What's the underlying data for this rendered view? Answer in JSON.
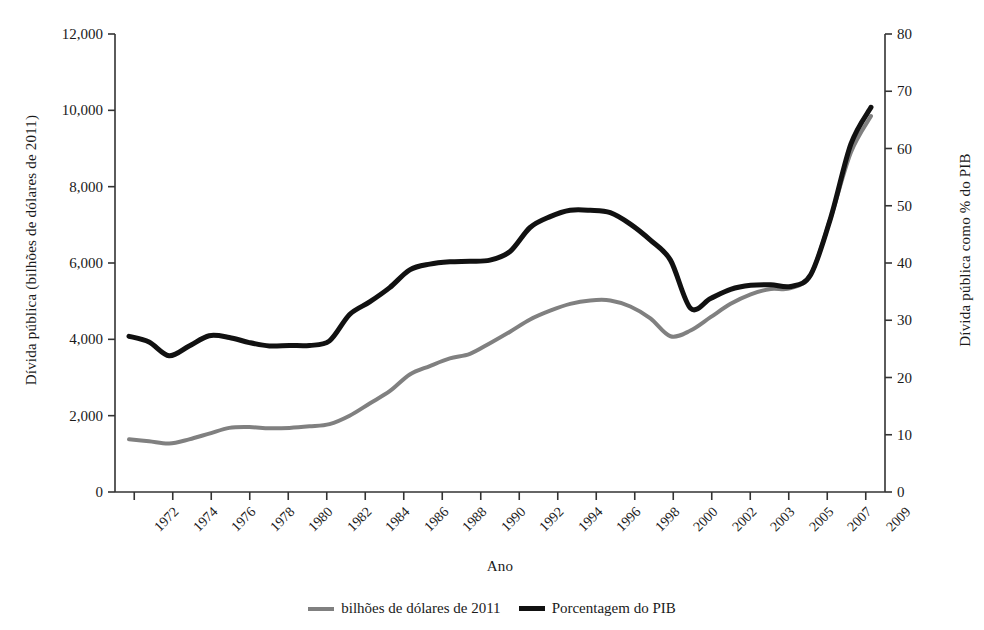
{
  "chart_data": {
    "type": "line",
    "title": "",
    "xlabel": "Ano",
    "ylabel_left": "Dívida pública (bilhões de dólares de 2011)",
    "ylabel_right": "Dívida pública como % do PIB",
    "grid": false,
    "legend_position": "bottom-center",
    "x_tick_labels": [
      "1972",
      "1974",
      "1976",
      "1978",
      "1980",
      "1982",
      "1984",
      "1986",
      "1988",
      "1990",
      "1992",
      "1994",
      "1996",
      "1998",
      "2000",
      "2002",
      "2003",
      "2005",
      "2007",
      "2009"
    ],
    "x_tick_count": 20,
    "y_left_ticks": [
      "0",
      "2,000",
      "4,000",
      "6,000",
      "8,000",
      "10,000",
      "12,000"
    ],
    "y_left_lim": [
      0,
      12000
    ],
    "y_right_ticks": [
      "0",
      "10",
      "20",
      "30",
      "40",
      "50",
      "60",
      "70",
      "80"
    ],
    "y_right_lim": [
      0,
      80
    ],
    "series": [
      {
        "name": "bilhões de dólares de 2011",
        "color": "#808080",
        "axis": "left",
        "linewidth": 4,
        "values": [
          1380,
          1330,
          1270,
          1380,
          1530,
          1680,
          1700,
          1670,
          1680,
          1720,
          1780,
          2000,
          2320,
          2640,
          3080,
          3300,
          3500,
          3620,
          3900,
          4200,
          4520,
          4750,
          4930,
          5020,
          5020,
          4860,
          4550,
          4080,
          4230,
          4580,
          4930,
          5180,
          5320,
          5340,
          5700,
          7200,
          8900,
          9850
        ]
      },
      {
        "name": "Porcentagem do PIB",
        "color": "#111111",
        "axis": "right",
        "linewidth": 5,
        "values": [
          27.2,
          26.2,
          23.8,
          25.5,
          27.3,
          27.0,
          26.1,
          25.5,
          25.6,
          25.6,
          26.4,
          31.0,
          33.2,
          35.7,
          38.8,
          39.8,
          40.2,
          40.3,
          40.5,
          42.0,
          46.2,
          48.1,
          49.2,
          49.2,
          48.8,
          46.8,
          44.0,
          40.5,
          32.1,
          33.8,
          35.4,
          36.1,
          36.2,
          35.9,
          38.0,
          48.0,
          60.8,
          67.2
        ]
      }
    ]
  },
  "legend": {
    "items": [
      {
        "label": "bilhões de dólares de 2011",
        "color": "#808080"
      },
      {
        "label": "Porcentagem do PIB",
        "color": "#111111"
      }
    ]
  }
}
